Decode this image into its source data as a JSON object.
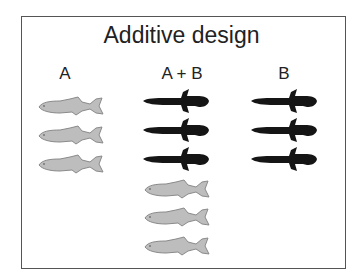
{
  "diagram": {
    "title": "Additive design",
    "columns": [
      {
        "label": "A",
        "fish": [
          {
            "species": "A",
            "color": "#bdbdbd"
          },
          {
            "species": "A",
            "color": "#bdbdbd"
          },
          {
            "species": "A",
            "color": "#bdbdbd"
          }
        ]
      },
      {
        "label": "A + B",
        "fish": [
          {
            "species": "B",
            "color": "#151515"
          },
          {
            "species": "B",
            "color": "#151515"
          },
          {
            "species": "B",
            "color": "#151515"
          },
          {
            "species": "A",
            "color": "#bdbdbd"
          },
          {
            "species": "A",
            "color": "#bdbdbd"
          },
          {
            "species": "A",
            "color": "#bdbdbd"
          }
        ]
      },
      {
        "label": "B",
        "fish": [
          {
            "species": "B",
            "color": "#151515"
          },
          {
            "species": "B",
            "color": "#151515"
          },
          {
            "species": "B",
            "color": "#151515"
          }
        ]
      }
    ]
  }
}
